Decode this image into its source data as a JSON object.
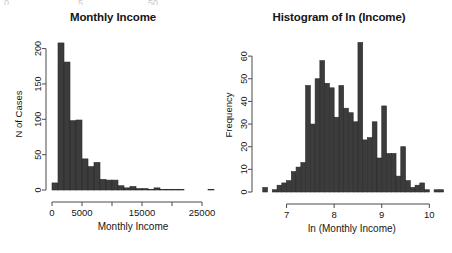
{
  "figure": {
    "background": "#ffffff",
    "bar_fill": "#3c3c3c",
    "bar_stroke": "#2a2a2a",
    "axis_color": "#4a4a4a",
    "text_color": "#151515",
    "remnants": [
      "0",
      "5",
      "50"
    ]
  },
  "panels": [
    {
      "id": "monthly-income",
      "title": "Monthly Income",
      "xlabel": "Monthly Income",
      "ylabel": "N of Cases"
    },
    {
      "id": "ln-income",
      "title": "Histogram of ln (Income)",
      "xlabel": "ln (Monthly Income)",
      "ylabel": "Frequency"
    }
  ],
  "chart_data": [
    {
      "type": "bar",
      "id": "monthly-income",
      "title": "Monthly Income",
      "xlabel": "Monthly Income",
      "ylabel": "N of Cases",
      "xlim": [
        0,
        27000
      ],
      "ylim": [
        0,
        215
      ],
      "xticks": [
        0,
        5000,
        10000,
        15000,
        20000,
        25000
      ],
      "xticklabels": [
        "0",
        "5000",
        "",
        "15000",
        "",
        "25000"
      ],
      "yticks": [
        0,
        50,
        100,
        150,
        200
      ],
      "yticklabels": [
        "0",
        "50",
        "100",
        "150",
        "200"
      ],
      "grid": false,
      "legend": false,
      "bin_width": 1000,
      "bin_starts": [
        0,
        1000,
        2000,
        3000,
        4000,
        5000,
        6000,
        7000,
        8000,
        9000,
        10000,
        11000,
        12000,
        13000,
        14000,
        15000,
        16000,
        17000,
        18000,
        19000,
        20000,
        21000,
        22000,
        23000,
        24000,
        25000,
        26000
      ],
      "values": [
        10,
        208,
        181,
        98,
        99,
        44,
        33,
        39,
        15,
        14,
        14,
        6,
        3,
        5,
        2,
        2,
        1,
        3,
        1,
        1,
        1,
        1,
        0,
        0,
        0,
        0,
        1
      ]
    },
    {
      "type": "bar",
      "id": "ln-income",
      "title": "Histogram of ln (Income)",
      "xlabel": "ln (Monthly Income)",
      "ylabel": "Frequency",
      "xlim": [
        6.4,
        10.35
      ],
      "ylim": [
        0,
        68
      ],
      "xticks": [
        7,
        8,
        9,
        10
      ],
      "xticklabels": [
        "7",
        "8",
        "9",
        "10"
      ],
      "yticks": [
        0,
        10,
        20,
        30,
        40,
        50,
        60
      ],
      "yticklabels": [
        "0",
        "10",
        "20",
        "30",
        "40",
        "50",
        "60"
      ],
      "grid": false,
      "legend": false,
      "bin_width": 0.1,
      "bin_starts": [
        6.5,
        6.6,
        6.7,
        6.8,
        6.9,
        7.0,
        7.1,
        7.2,
        7.3,
        7.4,
        7.5,
        7.6,
        7.7,
        7.8,
        7.9,
        8.0,
        8.1,
        8.2,
        8.3,
        8.4,
        8.5,
        8.6,
        8.7,
        8.8,
        8.9,
        9.0,
        9.1,
        9.2,
        9.3,
        9.4,
        9.5,
        9.6,
        9.7,
        9.8,
        9.9,
        10.0,
        10.1,
        10.2
      ],
      "values": [
        2,
        0,
        1,
        3,
        4,
        5,
        9,
        11,
        13,
        47,
        30,
        50,
        58,
        48,
        46,
        33,
        47,
        37,
        35,
        31,
        66,
        23,
        24,
        31,
        15,
        38,
        17,
        17,
        7,
        20,
        5,
        2,
        3,
        4,
        1,
        0,
        1,
        1
      ]
    }
  ]
}
